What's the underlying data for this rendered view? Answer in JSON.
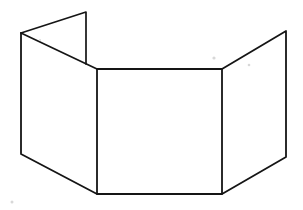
{
  "figure": {
    "canvas": {
      "width": 303,
      "height": 210,
      "background_color": "#ffffff"
    },
    "stroke": {
      "color": "#151515",
      "width": 1.7,
      "style": "hand-drawn-ink"
    },
    "vertices": {
      "left_flap_top_right": {
        "x": 86,
        "y": 12
      },
      "left_flap_top_left": {
        "x": 21,
        "y": 33
      },
      "left_panel_bottom_left": {
        "x": 19,
        "y": 154
      },
      "center_panel_top_left": {
        "x": 97,
        "y": 69
      },
      "center_panel_bottom_left": {
        "x": 97,
        "y": 194
      },
      "center_panel_top_right": {
        "x": 222,
        "y": 69
      },
      "center_panel_bottom_right": {
        "x": 222,
        "y": 194
      },
      "right_panel_top_right": {
        "x": 286,
        "y": 31
      },
      "right_panel_bottom_right": {
        "x": 286,
        "y": 157
      }
    },
    "paths": {
      "left_flap": "M 86 12 L 21 33 L 97 69 L 86 64 Z",
      "left_panel": "M 21 33 L 97 69 L 97 194 L 19 154 Z",
      "center_panel": "M 97 69 L 222 69 L 222 194 L 97 194 Z",
      "right_panel": "M 222 69 L 286 31 L 286 157 L 222 194 Z",
      "left_flap_outline": "M 21 33 L 86 12 L 86 64",
      "left_flap_fold": "M 21 33 L 97 69",
      "left_panel_outline": "M 21 33 L 21 154 L 97 194",
      "center_panel_outline": "M 97 69 L 97 194 L 222 194 L 222 69 L 97 69",
      "right_panel_outline": "M 222 69 L 286 31 L 286 157 L 222 194"
    },
    "specks": [
      {
        "x": 214,
        "y": 58,
        "r": 1.6
      },
      {
        "x": 249,
        "y": 65,
        "r": 1.3
      },
      {
        "x": 12,
        "y": 202,
        "r": 1.5
      },
      {
        "x": 40,
        "y": 40,
        "r": 1.0
      }
    ],
    "panels": [
      {
        "name": "rear-left-flap",
        "label": "Rear left flap"
      },
      {
        "name": "left-panel",
        "label": "Left panel"
      },
      {
        "name": "center-panel",
        "label": "Center panel"
      },
      {
        "name": "right-panel",
        "label": "Right panel"
      }
    ]
  }
}
